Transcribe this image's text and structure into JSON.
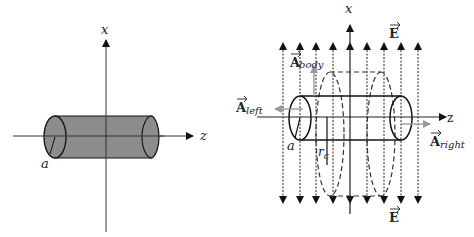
{
  "left_figure": {
    "axis_x_label": "x",
    "axis_z_label": "z",
    "radius_label": "a",
    "cylinder_fill": "#8c8c8c"
  },
  "right_figure": {
    "axis_x_label": "x",
    "axis_z_label": "z",
    "radius_label": "a",
    "gaussian_radius_label": "r",
    "gaussian_radius_subscript": "c",
    "field_label_top": "E",
    "field_label_bottom": "E",
    "area_body_label": "A",
    "area_body_subscript": "body",
    "area_left_label": "A",
    "area_left_subscript": "left",
    "area_right_label": "A",
    "area_right_subscript": "right",
    "area_vector_color": "#999999",
    "field_line_count": 9
  }
}
